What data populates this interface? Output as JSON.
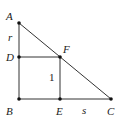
{
  "diagram": {
    "type": "geometry",
    "points": {
      "A": {
        "label": "A",
        "x": 19,
        "y": 23
      },
      "B": {
        "label": "B",
        "x": 19,
        "y": 99
      },
      "C": {
        "label": "C",
        "x": 111,
        "y": 99
      },
      "D": {
        "label": "D",
        "x": 19,
        "y": 57
      },
      "E": {
        "label": "E",
        "x": 60,
        "y": 99
      },
      "F": {
        "label": "F",
        "x": 60,
        "y": 57
      }
    },
    "segment_labels": {
      "AD": "r",
      "EF": "1",
      "EC": "s"
    },
    "colors": {
      "stroke": "#333333",
      "point": "#111111",
      "text": "#222222"
    }
  }
}
